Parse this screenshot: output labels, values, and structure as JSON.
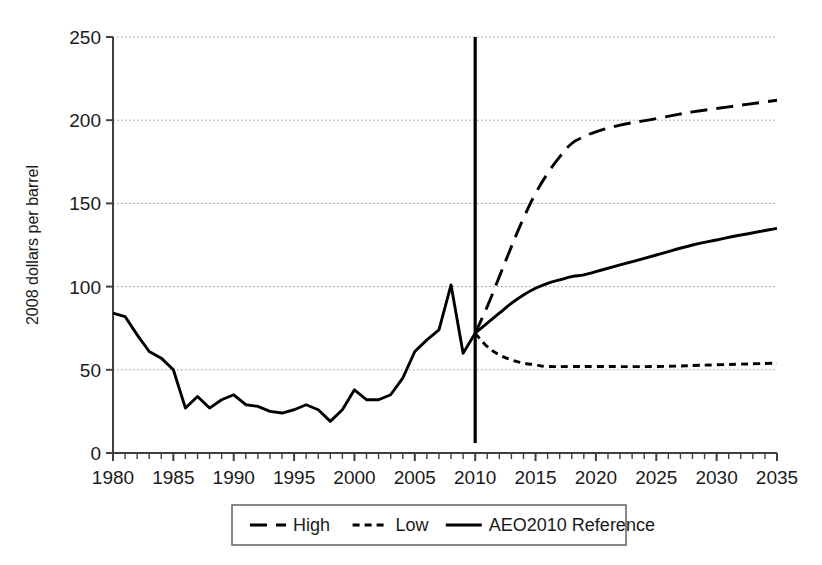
{
  "chart_data": {
    "type": "line",
    "title": "",
    "subtitle": "",
    "xlabel": "",
    "ylabel": "2008 dollars per barrel",
    "xlim": [
      1980,
      2035
    ],
    "ylim": [
      0,
      250
    ],
    "ytick_labels": [
      "0",
      "50",
      "100",
      "150",
      "200",
      "250"
    ],
    "ytick_values": [
      0,
      50,
      100,
      150,
      200,
      250
    ],
    "xtick_labels": [
      "1980",
      "1985",
      "1990",
      "1995",
      "2000",
      "2005",
      "2010",
      "2015",
      "2020",
      "2025",
      "2030",
      "2035"
    ],
    "xtick_values": [
      1980,
      1985,
      1990,
      1995,
      2000,
      2005,
      2010,
      2015,
      2020,
      2025,
      2030,
      2035
    ],
    "minor_xticks_interval": 1,
    "grid": "horizontal-dotted",
    "legend_position": "bottom-center",
    "legend_entries": [
      "High",
      "Low",
      "AEO2010 Reference"
    ],
    "history_projection_divider_year": 2010,
    "line_color": "#000000",
    "grid_color": "#999999",
    "axis_color": "#404040",
    "series": [
      {
        "name": "History",
        "style": "solid",
        "x": [
          1980,
          1981,
          1982,
          1983,
          1984,
          1985,
          1986,
          1987,
          1988,
          1989,
          1990,
          1991,
          1992,
          1993,
          1994,
          1995,
          1996,
          1997,
          1998,
          1999,
          2000,
          2001,
          2002,
          2003,
          2004,
          2005,
          2006,
          2007,
          2008,
          2009,
          2010
        ],
        "values": [
          84,
          82,
          71,
          61,
          57,
          50,
          27,
          34,
          27,
          32,
          35,
          29,
          28,
          25,
          24,
          26,
          29,
          26,
          19,
          26,
          38,
          32,
          32,
          35,
          45,
          61,
          68,
          74,
          101,
          60,
          72
        ]
      },
      {
        "name": "High",
        "style": "dashed",
        "x": [
          2010,
          2011,
          2012,
          2013,
          2014,
          2015,
          2016,
          2017,
          2018,
          2019,
          2020,
          2022,
          2025,
          2028,
          2030,
          2032,
          2035
        ],
        "values": [
          72,
          88,
          106,
          124,
          141,
          156,
          168,
          178,
          186,
          190,
          193,
          197,
          201,
          205,
          207,
          209,
          212
        ]
      },
      {
        "name": "Low",
        "style": "dotted",
        "x": [
          2010,
          2011,
          2012,
          2013,
          2014,
          2015,
          2016,
          2018,
          2020,
          2025,
          2030,
          2035
        ],
        "values": [
          72,
          64,
          59,
          56,
          54,
          53,
          52,
          52,
          52,
          52,
          53,
          54
        ]
      },
      {
        "name": "AEO2010 Reference",
        "style": "solid",
        "x": [
          2010,
          2011,
          2012,
          2013,
          2014,
          2015,
          2016,
          2017,
          2018,
          2019,
          2020,
          2022,
          2025,
          2028,
          2030,
          2032,
          2035
        ],
        "values": [
          72,
          78,
          84,
          90,
          95,
          99,
          102,
          104,
          106,
          107,
          109,
          113,
          119,
          125,
          128,
          131,
          135
        ]
      }
    ]
  },
  "legend": {
    "items": [
      {
        "label": "High",
        "style": "dashed"
      },
      {
        "label": "Low",
        "style": "dotted"
      },
      {
        "label": "AEO2010 Reference",
        "style": "solid"
      }
    ]
  },
  "axes": {
    "y_title": "2008 dollars per barrel"
  }
}
